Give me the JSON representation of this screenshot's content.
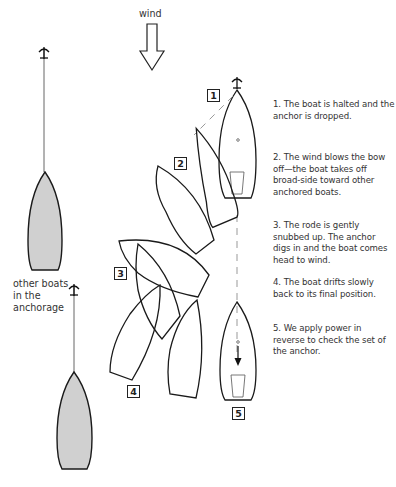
{
  "diagram": {
    "wind_label": "wind",
    "other_boats_label_lines": [
      "other boats",
      "in the",
      "anchorage"
    ],
    "step_markers": [
      "1",
      "2",
      "3",
      "4",
      "5"
    ],
    "steps": [
      {
        "number": "1",
        "text": "1. The boat is halted and the anchor is dropped."
      },
      {
        "number": "2",
        "text": "2. The wind blows the bow off—the boat takes off broad-side toward other anchored boats."
      },
      {
        "number": "3",
        "text": "3. The rode is gently snubbed up. The anchor digs in and the boat comes head to wind."
      },
      {
        "number": "4",
        "text": "4. The boat drifts slowly back to its final position."
      },
      {
        "number": "5",
        "text": "5. We apply power in reverse to check the set of the anchor."
      }
    ],
    "colors": {
      "outline": "#1a1a1a",
      "anchored_boat_fill": "#d0d0d0",
      "rode_dashed": "#999999",
      "cockpit": "#555555"
    },
    "icons": [
      "wind-arrow-icon",
      "anchor-icon",
      "boat-hull-icon",
      "reverse-arrow-icon"
    ]
  }
}
